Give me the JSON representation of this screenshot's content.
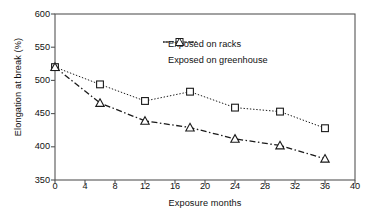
{
  "chart_data": {
    "type": "line",
    "title": "",
    "xlabel": "Exposure months",
    "ylabel": "Elongation at break (%)",
    "xlim": [
      0,
      40
    ],
    "ylim": [
      350,
      600
    ],
    "xticks": [
      "0",
      "4",
      "8",
      "12",
      "16",
      "20",
      "24",
      "28",
      "32",
      "36",
      "40"
    ],
    "yticks": [
      "350",
      "400",
      "450",
      "500",
      "550",
      "600"
    ],
    "grid": false,
    "legend_position": "upper-center",
    "x": [
      0,
      6,
      12,
      18,
      24,
      30,
      36
    ],
    "series": [
      {
        "name": "Exposed on racks",
        "values": [
          520,
          494,
          469,
          483,
          459,
          453,
          428
        ],
        "marker": "square",
        "linestyle": "dotted",
        "color": "#1a1a1a"
      },
      {
        "name": "Exposed on greenhouse",
        "values": [
          520,
          466,
          439,
          429,
          412,
          402,
          382
        ],
        "marker": "triangle",
        "linestyle": "dashdot",
        "color": "#1a1a1a"
      }
    ]
  },
  "legend": {
    "items": [
      {
        "label": "Exposed on racks",
        "marker": "square-marker-icon"
      },
      {
        "label": "Exposed on greenhouse",
        "marker": "triangle-marker-icon"
      }
    ]
  },
  "axes": {
    "y_title": "Elongation at break (%)",
    "x_title": "Exposure months",
    "y_tick_labels": [
      "600",
      "550",
      "500",
      "450",
      "400",
      "350"
    ],
    "x_tick_labels": [
      "0",
      "4",
      "8",
      "12",
      "16",
      "20",
      "24",
      "28",
      "32",
      "36",
      "40"
    ]
  },
  "colors": {
    "axis": "#555555",
    "series_line": "#1a1a1a",
    "background": "#ffffff"
  }
}
